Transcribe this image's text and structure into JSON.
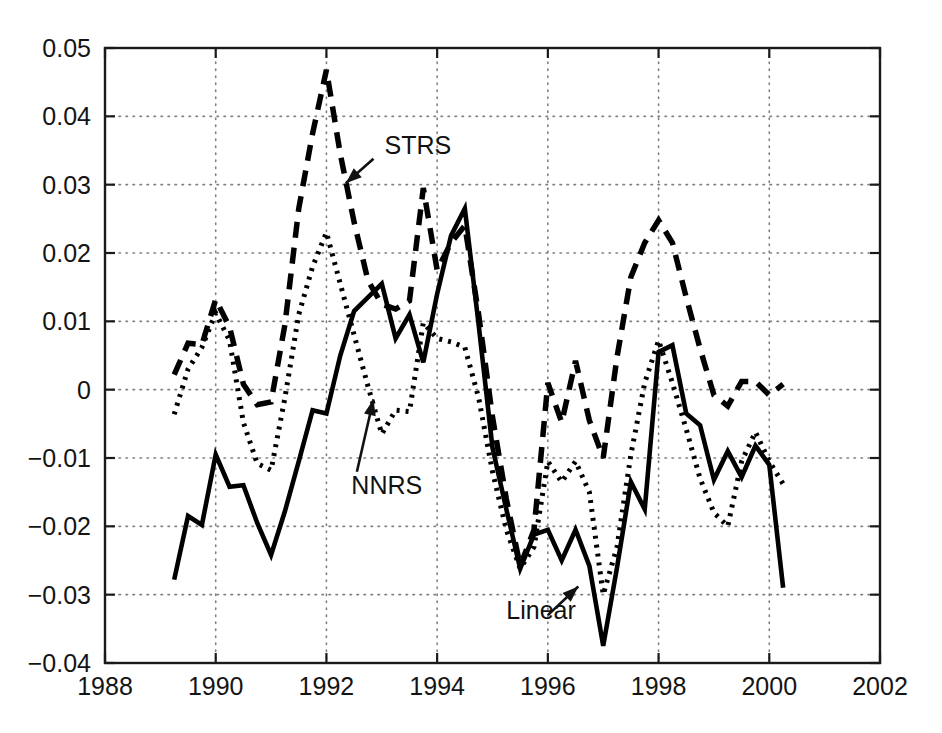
{
  "chart_data": {
    "type": "line",
    "title": "",
    "subtitle": "",
    "xlabel": "",
    "ylabel": "",
    "xlim": [
      1988,
      2002
    ],
    "ylim": [
      -0.04,
      0.05
    ],
    "grid": true,
    "legend_position": "inline-annotations",
    "xticks": [
      "1988",
      "1990",
      "1992",
      "1994",
      "1996",
      "1998",
      "2000",
      "2002"
    ],
    "xtick_values": [
      1988,
      1990,
      1992,
      1994,
      1996,
      1998,
      2000,
      2002
    ],
    "yticks": [
      "0.05",
      "0.04",
      "0.03",
      "0.02",
      "0.01",
      "0",
      "-0.01",
      "-0.02",
      "-0.03",
      "-0.04"
    ],
    "ytick_values": [
      0.05,
      0.04,
      0.03,
      0.02,
      0.01,
      0,
      -0.01,
      -0.02,
      -0.03,
      -0.04
    ],
    "x": [
      1989.25,
      1989.5,
      1989.75,
      1990.0,
      1990.25,
      1990.5,
      1990.75,
      1991.0,
      1991.25,
      1991.5,
      1991.75,
      1992.0,
      1992.25,
      1992.5,
      1992.75,
      1993.0,
      1993.25,
      1993.5,
      1993.75,
      1994.0,
      1994.25,
      1994.5,
      1994.75,
      1995.0,
      1995.25,
      1995.5,
      1995.75,
      1996.0,
      1996.25,
      1996.5,
      1996.75,
      1997.0,
      1997.25,
      1997.5,
      1997.75,
      1998.0,
      1998.25,
      1998.5,
      1998.75,
      1999.0,
      1999.25,
      1999.5,
      1999.75,
      2000.0,
      2000.25
    ],
    "series": [
      {
        "name": "STRS",
        "style": "dashed",
        "color": "#000000",
        "values": [
          0.0022,
          0.0068,
          0.0066,
          0.0132,
          0.0092,
          0.0008,
          -0.0022,
          -0.0018,
          0.0095,
          0.0265,
          0.0375,
          0.0468,
          0.0345,
          0.0245,
          0.016,
          0.0125,
          0.0118,
          0.013,
          0.0295,
          0.0175,
          0.0215,
          0.024,
          0.011,
          -0.004,
          -0.016,
          -0.0258,
          -0.0205,
          0.001,
          -0.0048,
          0.0042,
          -0.0045,
          -0.01,
          0.0048,
          0.0165,
          0.0215,
          0.0248,
          0.0215,
          0.0135,
          0.006,
          -0.0008,
          -0.0024,
          0.0012,
          0.0012,
          -0.0008,
          0.0008
        ]
      },
      {
        "name": "NNRS",
        "style": "dotted",
        "color": "#000000",
        "values": [
          -0.0036,
          0.003,
          0.0062,
          0.0112,
          0.0072,
          -0.0048,
          -0.0108,
          -0.0118,
          -0.0012,
          0.011,
          0.018,
          0.023,
          0.0155,
          0.008,
          0.0005,
          -0.0065,
          -0.003,
          -0.0032,
          0.0098,
          0.0075,
          0.007,
          0.0062,
          -0.0012,
          -0.012,
          -0.0205,
          -0.0262,
          -0.023,
          -0.0105,
          -0.0135,
          -0.0105,
          -0.015,
          -0.03,
          -0.023,
          -0.0095,
          0.001,
          0.0072,
          0.001,
          -0.0058,
          -0.013,
          -0.018,
          -0.02,
          -0.0105,
          -0.0062,
          -0.0105,
          -0.0138
        ]
      },
      {
        "name": "Linear",
        "style": "solid",
        "color": "#000000",
        "values": [
          -0.0278,
          -0.0185,
          -0.0198,
          -0.0095,
          -0.0142,
          -0.014,
          -0.0195,
          -0.0242,
          -0.0178,
          -0.0105,
          -0.003,
          -0.0035,
          0.005,
          0.0115,
          0.0135,
          0.0155,
          0.0075,
          0.011,
          0.004,
          0.014,
          0.0225,
          0.0265,
          0.0095,
          -0.0085,
          -0.0175,
          -0.0262,
          -0.0212,
          -0.0205,
          -0.025,
          -0.0205,
          -0.0258,
          -0.0375,
          -0.026,
          -0.0135,
          -0.0175,
          0.0055,
          0.0065,
          -0.0035,
          -0.0052,
          -0.0132,
          -0.009,
          -0.0128,
          -0.0082,
          -0.011,
          -0.029
        ]
      }
    ],
    "annotations": [
      {
        "label": "STRS",
        "text_x": 1993.05,
        "text_y": 0.0345,
        "arrow_from_x": 1992.85,
        "arrow_from_y": 0.0338,
        "arrow_to_x": 1992.35,
        "arrow_to_y": 0.0302
      },
      {
        "label": "NNRS",
        "text_x": 1992.45,
        "text_y": -0.0152,
        "arrow_from_x": 1992.55,
        "arrow_from_y": -0.012,
        "arrow_to_x": 1992.85,
        "arrow_to_y": -0.0014
      },
      {
        "label": "Linear",
        "text_x": 1995.25,
        "text_y": -0.0335,
        "arrow_from_x": 1996.0,
        "arrow_from_y": -0.033,
        "arrow_to_x": 1996.55,
        "arrow_to_y": -0.0288
      }
    ]
  },
  "figure": {
    "background_color": "#ffffff",
    "axis_color": "#1a1a1a",
    "grid_color": "#808080"
  }
}
